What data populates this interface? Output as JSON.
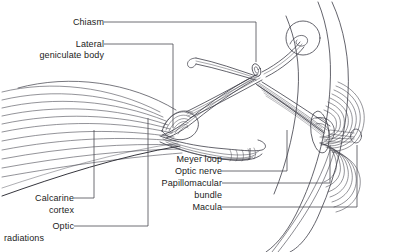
{
  "figure": {
    "style": "line-art anatomical illustration",
    "background_color": "#ffffff",
    "line_color": "#3c3c46",
    "text_color": "#1b1b1b"
  },
  "labels": [
    {
      "id": "chiasm",
      "text": "Chiasm",
      "align": "right"
    },
    {
      "id": "lateral",
      "text": "Lateral",
      "align": "right"
    },
    {
      "id": "geniculate-body",
      "text": "geniculate body",
      "align": "right"
    },
    {
      "id": "meyer-loop",
      "text": "Meyer loop",
      "align": "right"
    },
    {
      "id": "optic-nerve",
      "text": "Optic nerve",
      "align": "right"
    },
    {
      "id": "papillomacular",
      "text": "Papillomacular",
      "align": "right"
    },
    {
      "id": "bundle",
      "text": "bundle",
      "align": "right"
    },
    {
      "id": "macula",
      "text": "Macula",
      "align": "right"
    },
    {
      "id": "calcarine",
      "text": "Calcarine",
      "align": "right"
    },
    {
      "id": "cortex",
      "text": "cortex",
      "align": "right"
    },
    {
      "id": "optic",
      "text": "Optic",
      "align": "right"
    },
    {
      "id": "radiations",
      "text": "radiations",
      "align": "right"
    }
  ],
  "structures": [
    {
      "id": "optic-radiations-fan",
      "name": "optic radiations fan",
      "description": "fan of curved nerve fiber lines sweeping from left edge toward lateral geniculate body"
    },
    {
      "id": "calcarine-cortex",
      "name": "calcarine cortex",
      "description": "dark boundary curve at lower left of the radiation fan"
    },
    {
      "id": "lateral-geniculate",
      "name": "lateral geniculate body",
      "description": "teardrop pod with concentric striations"
    },
    {
      "id": "meyer-loop",
      "name": "Meyer loop",
      "description": "lower looping fiber bundle beneath geniculate body"
    },
    {
      "id": "optic-chiasm",
      "name": "optic chiasm",
      "description": "X-shaped crossing of two striated tracts with small central oval"
    },
    {
      "id": "optic-nerve",
      "name": "optic nerve",
      "description": "striated band running from chiasm down-right to the globe"
    },
    {
      "id": "contralateral-nerve-head",
      "name": "contralateral optic nerve head",
      "description": "small circle with inner spiral at upper right"
    },
    {
      "id": "retina",
      "name": "retina",
      "description": "concentric arcing retinal nerve fibers at right"
    },
    {
      "id": "macula",
      "name": "macula",
      "description": "center of the concentric retinal arcs"
    },
    {
      "id": "papillomacular-bundle",
      "name": "papillomacular bundle",
      "description": "straight fiber bundle from macula to optic disc"
    },
    {
      "id": "globe-outline",
      "name": "globe outline",
      "description": "large arc of the eye / skull outline at right"
    }
  ]
}
